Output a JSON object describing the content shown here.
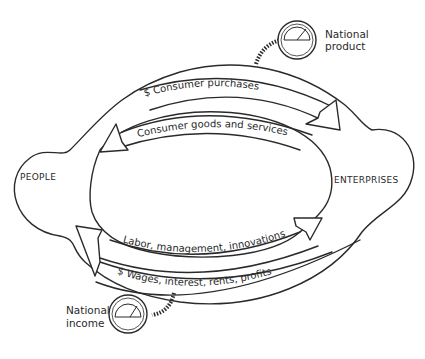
{
  "diagram": {
    "nodes": {
      "people": "PEOPLE",
      "enterprises": "ENTERPRISES"
    },
    "flows": {
      "consumer_purchases": "$ Consumer purchases",
      "consumer_goods": "Consumer goods and services",
      "labor": "Labor, management, innovations",
      "wages": "$  Wages, interest, rents, profits"
    },
    "gauges": {
      "national_product": {
        "line1": "National",
        "line2": "product"
      },
      "national_income": {
        "line1": "National",
        "line2": "income"
      }
    },
    "colors": {
      "ink": "#2a2a2a",
      "background": "#ffffff"
    }
  }
}
